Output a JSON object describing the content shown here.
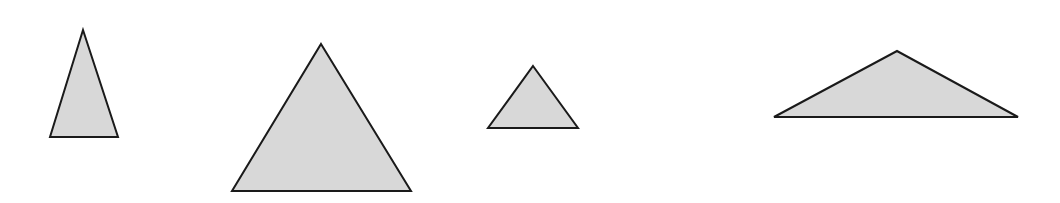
{
  "diagram": {
    "width": 1060,
    "height": 203,
    "background": "#ffffff",
    "style": {
      "fill": "#d8d8d8",
      "stroke": "#1a1a1a",
      "stroke_width": 2
    },
    "triangles": [
      {
        "id": "triangle-1",
        "shape": "tall-narrow isosceles",
        "points": [
          [
            83,
            30
          ],
          [
            118,
            137
          ],
          [
            50,
            137
          ]
        ]
      },
      {
        "id": "triangle-2",
        "shape": "large equilateral-like",
        "points": [
          [
            321,
            44
          ],
          [
            411,
            191
          ],
          [
            232,
            191
          ]
        ]
      },
      {
        "id": "triangle-3",
        "shape": "small equilateral-like",
        "points": [
          [
            533,
            66
          ],
          [
            578,
            128
          ],
          [
            488,
            128
          ]
        ]
      },
      {
        "id": "triangle-4",
        "shape": "wide obtuse isosceles",
        "points": [
          [
            897,
            51
          ],
          [
            1018,
            117
          ],
          [
            774,
            117
          ]
        ]
      }
    ]
  }
}
